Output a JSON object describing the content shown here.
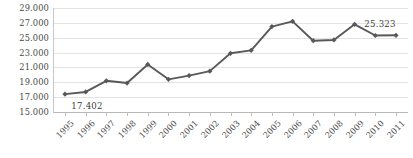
{
  "chart_data": {
    "type": "line",
    "title": "",
    "subtitle": "",
    "xlabel": "",
    "ylabel": "",
    "grid": true,
    "legend": "none",
    "marker": "diamond",
    "series_color": "#595959",
    "gridline_color": "#E3E3E3",
    "categories": [
      "1995",
      "1996",
      "1997",
      "1998",
      "1999",
      "2000",
      "2001",
      "2002",
      "2003",
      "2004",
      "2005",
      "2006",
      "2007",
      "2008",
      "2009",
      "2010",
      "2011"
    ],
    "values": [
      17402,
      17700,
      19200,
      18900,
      21400,
      19400,
      19900,
      20500,
      22900,
      23300,
      26500,
      27200,
      24600,
      24700,
      26800,
      25300,
      25323
    ],
    "ylim": [
      15000,
      29000
    ],
    "ytick_values": [
      15000,
      17000,
      19000,
      21000,
      23000,
      25000,
      27000,
      29000
    ],
    "ytick_labels": [
      "15.000",
      "17.000",
      "19.000",
      "21.000",
      "23.000",
      "25.000",
      "27.000",
      "29.000"
    ],
    "point_labels": [
      {
        "category": "1995",
        "text": "17.402",
        "position": "below"
      },
      {
        "category": "2011",
        "text": "25.323",
        "position": "above-left"
      }
    ]
  }
}
